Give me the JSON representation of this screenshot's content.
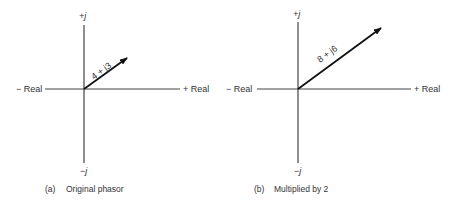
{
  "panels": [
    {
      "id": "a",
      "caption_letter": "(a)",
      "caption_text": "Original phasor",
      "axis_labels": {
        "neg_real": "− Real",
        "pos_real": "+ Real",
        "pos_imag": "+j",
        "neg_imag": "−j"
      },
      "phasor_label": "4 + j3"
    },
    {
      "id": "b",
      "caption_letter": "(b)",
      "caption_text": "Multiplied by 2",
      "axis_labels": {
        "neg_real": "− Real",
        "pos_real": "+ Real",
        "pos_imag": "+j",
        "neg_imag": "−j"
      },
      "phasor_label": "8 + j6"
    }
  ],
  "colors": {
    "axis": "#444444",
    "vector": "#111111",
    "text": "#333333"
  }
}
